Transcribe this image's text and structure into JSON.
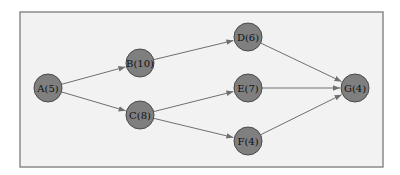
{
  "diagram": {
    "type": "directed-network",
    "frame": {
      "x": 20,
      "y": 12,
      "width": 363,
      "height": 155
    },
    "node_radius": 14,
    "colors": {
      "frame_fill": "#f2f2f2",
      "frame_stroke": "#8a8a8a",
      "node_fill": "#7f7f7f",
      "node_stroke": "#4a4a4a",
      "edge": "#6f6f6f",
      "label": "#111111"
    },
    "nodes": [
      {
        "id": "A",
        "label": "A(5)",
        "x": 48,
        "y": 88
      },
      {
        "id": "B",
        "label": "B(10)",
        "x": 140,
        "y": 63
      },
      {
        "id": "C",
        "label": "C(8)",
        "x": 140,
        "y": 115
      },
      {
        "id": "D",
        "label": "D(6)",
        "x": 248,
        "y": 37
      },
      {
        "id": "E",
        "label": "E(7)",
        "x": 248,
        "y": 88
      },
      {
        "id": "F",
        "label": "F(4)",
        "x": 248,
        "y": 141
      },
      {
        "id": "G",
        "label": "G(4)",
        "x": 355,
        "y": 88
      }
    ],
    "edges": [
      {
        "from": "A",
        "to": "B"
      },
      {
        "from": "A",
        "to": "C"
      },
      {
        "from": "B",
        "to": "D"
      },
      {
        "from": "C",
        "to": "E"
      },
      {
        "from": "C",
        "to": "F"
      },
      {
        "from": "D",
        "to": "G"
      },
      {
        "from": "E",
        "to": "G"
      },
      {
        "from": "F",
        "to": "G"
      }
    ]
  }
}
